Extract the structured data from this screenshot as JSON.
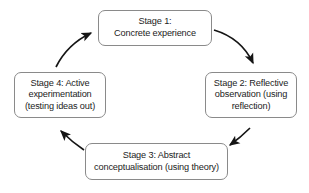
{
  "diagram": {
    "type": "cycle-diagram",
    "colors": {
      "background": "#ffffff",
      "box_border": "#8a8a8a",
      "box_fill": "#ffffff",
      "text": "#1c1c1c",
      "arrow": "#151515"
    },
    "nodes": [
      {
        "id": "stage-1",
        "label": "Stage 1:\nConcrete experience",
        "position": "top"
      },
      {
        "id": "stage-2",
        "label": "Stage 2: Reflective\nobservation (using\nreflection)",
        "position": "right"
      },
      {
        "id": "stage-3",
        "label": "Stage 3: Abstract\nconceptualisation (using theory)",
        "position": "bottom"
      },
      {
        "id": "stage-4",
        "label": "Stage 4: Active\nexperimentation\n(testing ideas out)",
        "position": "left"
      }
    ],
    "arrows": [
      {
        "id": "arrow-1-to-2",
        "from": "stage-1",
        "to": "stage-2",
        "direction": "clockwise-top-right"
      },
      {
        "id": "arrow-2-to-3",
        "from": "stage-2",
        "to": "stage-3",
        "direction": "clockwise-bottom-right"
      },
      {
        "id": "arrow-3-to-4",
        "from": "stage-3",
        "to": "stage-4",
        "direction": "clockwise-bottom-left"
      },
      {
        "id": "arrow-4-to-1",
        "from": "stage-4",
        "to": "stage-1",
        "direction": "clockwise-top-left"
      }
    ]
  }
}
